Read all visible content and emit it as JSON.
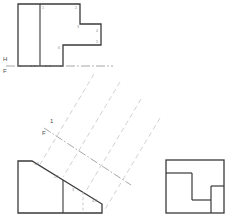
{
  "drawing": {
    "title": "Orthographic multiview projection with auxiliary projection rays",
    "colors": {
      "object_line": "#3a3a3a",
      "thin_line": "#555555",
      "projection_line": "#c9c9c9",
      "reference_line": "#8f8f8f",
      "label_text": "#5a5a5a",
      "background": "#ffffff"
    },
    "caption": "",
    "reference_planes": [
      {
        "name": "horizontal-frontal-reference-line",
        "upper_label": "H",
        "lower_label": "F",
        "orientation": "horizontal"
      },
      {
        "name": "auxiliary-frontal-reference-line",
        "upper_label": "1",
        "lower_label": "F",
        "orientation": "inclined"
      }
    ],
    "views": {
      "top": {
        "name": "top-view",
        "label": "",
        "vertex_labels": [
          "1",
          "2",
          "3",
          "4",
          "5",
          "6"
        ]
      },
      "front": {
        "name": "front-view",
        "label": "",
        "vertex_labels": [
          "1,6",
          "2,5",
          "3",
          "4,3"
        ]
      },
      "side": {
        "name": "right-side-view",
        "label": "",
        "vertex_labels": []
      }
    },
    "projection_rays": {
      "name": "auxiliary-projection-rays",
      "count": 4,
      "style": "dashed"
    }
  }
}
